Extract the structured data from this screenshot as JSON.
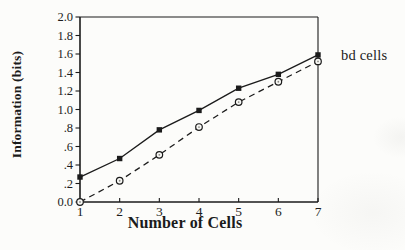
{
  "colors": {
    "ink": "#1b1b1b",
    "paper": "#fcfcfa",
    "open_marker_fill": "#f8f8f5"
  },
  "chart_data": {
    "type": "line",
    "title": "",
    "xlabel": "Number of Cells",
    "ylabel": "Information (bits)",
    "annotation": "bd cells",
    "x": [
      1,
      2,
      3,
      4,
      5,
      6,
      7
    ],
    "xtick_labels": [
      "1",
      "2",
      "3",
      "4",
      "5",
      "6",
      "7"
    ],
    "ytick_labels": [
      "0.0",
      ".2",
      ".4",
      ".6",
      ".8",
      "1.0",
      "1.2",
      "1.4",
      "1.6",
      "1.8",
      "2.0"
    ],
    "xlim": [
      1,
      7
    ],
    "ylim": [
      0.0,
      2.0
    ],
    "ytick_step": 0.2,
    "grid": false,
    "plot_frame": "full-box",
    "legend_position": "annotation-right-of-last-point",
    "series": [
      {
        "name": "bd cells (solid line, filled squares)",
        "line_style": "solid",
        "marker": "filled-square",
        "color": "#1b1b1b",
        "values": [
          0.27,
          0.47,
          0.78,
          0.99,
          1.23,
          1.38,
          1.59
        ]
      },
      {
        "name": "comparison (dashed line, open circles)",
        "line_style": "dashed",
        "marker": "open-circle",
        "color": "#1b1b1b",
        "values": [
          0.0,
          0.23,
          0.51,
          0.81,
          1.08,
          1.3,
          1.52
        ]
      }
    ]
  }
}
